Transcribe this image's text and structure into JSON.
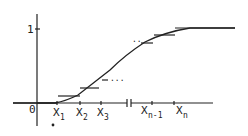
{
  "diagram": {
    "y_tick_label": "1",
    "origin_label": "0",
    "x_labels": [
      {
        "base": "X",
        "sub": "1"
      },
      {
        "base": "X",
        "sub": "2"
      },
      {
        "base": "X",
        "sub": "3"
      },
      {
        "base": "X",
        "sub": "n-1"
      },
      {
        "base": "X",
        "sub": "n"
      }
    ],
    "ellipsis_mid": "...",
    "ellipsis_top": "..",
    "axis_break_symbol": "||"
  }
}
